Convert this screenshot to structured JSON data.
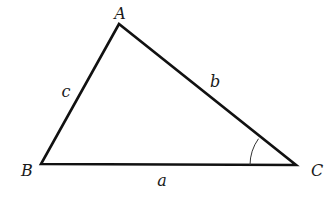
{
  "diagram": {
    "vertices": [
      {
        "name": "A",
        "label": "A",
        "x": 119,
        "y": 24,
        "label_x": 120,
        "label_y": 19
      },
      {
        "name": "B",
        "label": "B",
        "x": 41,
        "y": 164,
        "label_x": 27,
        "label_y": 176
      },
      {
        "name": "C",
        "label": "C",
        "x": 296,
        "y": 165,
        "label_x": 317,
        "label_y": 176
      }
    ],
    "sides": [
      {
        "name": "a",
        "label": "a",
        "from": "B",
        "to": "C",
        "label_x": 162,
        "label_y": 186
      },
      {
        "name": "b",
        "label": "b",
        "from": "A",
        "to": "C",
        "label_x": 215,
        "label_y": 87
      },
      {
        "name": "c",
        "label": "c",
        "from": "A",
        "to": "B",
        "label_x": 66,
        "label_y": 97
      }
    ],
    "angle_marker": {
      "vertex": "C",
      "radius": 46
    },
    "colors": {
      "stroke": "#111111",
      "text": "#1a1a1a",
      "background": "#ffffff"
    }
  }
}
